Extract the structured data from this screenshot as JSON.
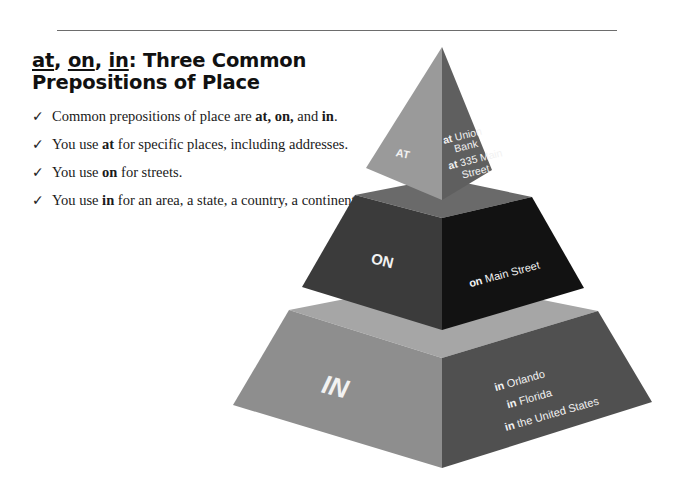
{
  "header": {
    "title_parts": [
      "at",
      ", ",
      "on",
      ", ",
      "in",
      ": Three Common Prepositions of Place"
    ]
  },
  "bullets": [
    {
      "pre": "Common prepositions of place are ",
      "b1": "at, on,",
      "mid": " and ",
      "b2": "in",
      "post": "."
    },
    {
      "pre": "You use ",
      "b1": "at",
      "post": " for specific places, including addresses."
    },
    {
      "pre": "You use ",
      "b1": "on",
      "post": " for streets."
    },
    {
      "pre": "You use ",
      "b1": "in",
      "post": " for an area, a state, a country, a continent."
    }
  ],
  "check_icon": "✓",
  "pyramid": {
    "tiers": [
      {
        "label": "AT",
        "examples": [
          {
            "prep": "at",
            "text": " Union"
          },
          {
            "prep": "",
            "text": "Bank"
          },
          {
            "prep": "at",
            "text": " 335 Main"
          },
          {
            "prep": "",
            "text": "Street"
          }
        ],
        "colors": {
          "left": "#9a9a9a",
          "right": "#5f5f5f"
        }
      },
      {
        "label": "ON",
        "examples": [
          {
            "prep": "on",
            "text": " Main Street"
          }
        ],
        "colors": {
          "top": "#6a6a6a",
          "left": "#3b3b3b",
          "right": "#121212"
        }
      },
      {
        "label": "IN",
        "examples": [
          {
            "prep": "in",
            "text": " Orlando"
          },
          {
            "prep": "in",
            "text": " Florida"
          },
          {
            "prep": "in",
            "text": " the United States"
          }
        ],
        "colors": {
          "top": "#a6a6a6",
          "left": "#8e8e8e",
          "right": "#505050"
        }
      }
    ]
  }
}
